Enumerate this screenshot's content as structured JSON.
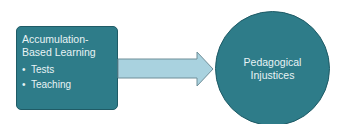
{
  "diagram": {
    "source_box": {
      "title_line1": "Accumulation-",
      "title_line2": "Based Learning",
      "bullets": [
        "Tests",
        "Teaching"
      ],
      "bullet_glyph": "•",
      "color": "#2e7c89"
    },
    "arrow": {
      "direction": "right",
      "color": "#a9d2df"
    },
    "target_circle": {
      "line1": "Pedagogical",
      "line2": "Injustices",
      "color": "#2e7c89"
    }
  }
}
